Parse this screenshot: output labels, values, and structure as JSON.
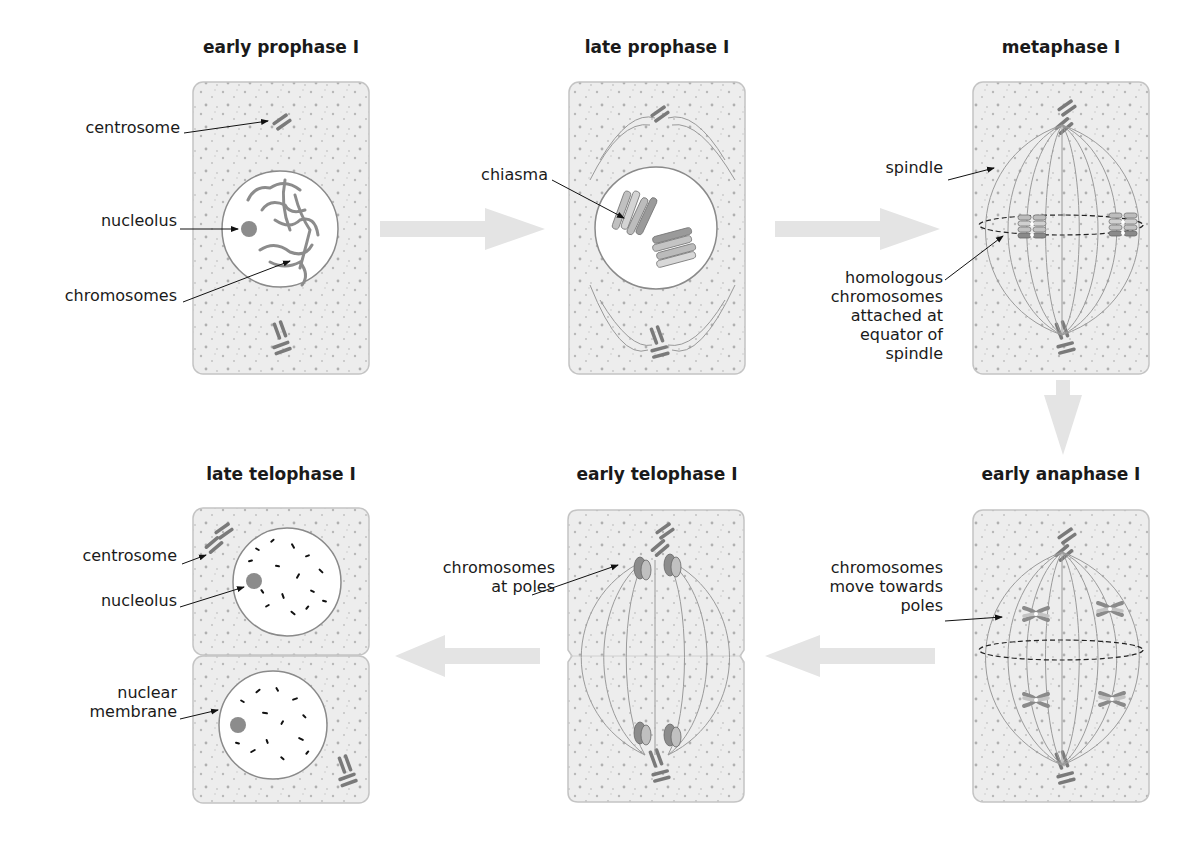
{
  "diagram": {
    "colors": {
      "cell_fill": "#ededed",
      "cell_border": "#c4c4c4",
      "nucleus_fill": "#ffffff",
      "nucleus_border": "#8a8a8a",
      "chromosome_dark": "#7c7c7c",
      "chromosome_light": "#bdbdbd",
      "spindle": "#8c8c8c",
      "flow_arrow": "#e4e4e4",
      "label_text": "#1a1a1a",
      "leader_line": "#111111"
    },
    "stages": [
      {
        "id": "early-prophase-1",
        "title": "early prophase I",
        "labels": [
          "centrosome",
          "nucleolus",
          "chromosomes"
        ]
      },
      {
        "id": "late-prophase-1",
        "title": "late prophase I",
        "labels": [
          "chiasma"
        ]
      },
      {
        "id": "metaphase-1",
        "title": "metaphase I",
        "labels": [
          "spindle",
          "homologous\nchromosomes\nattached at\nequator of\nspindle"
        ]
      },
      {
        "id": "early-anaphase-1",
        "title": "early anaphase I",
        "labels": [
          "chromosomes\nmove towards\npoles"
        ]
      },
      {
        "id": "early-telophase-1",
        "title": "early telophase I",
        "labels": [
          "chromosomes\nat poles"
        ]
      },
      {
        "id": "late-telophase-1",
        "title": "late telophase I",
        "labels": [
          "centrosome",
          "nucleolus",
          "nuclear\nmembrane"
        ]
      }
    ],
    "flow": [
      "early prophase I",
      "late prophase I",
      "metaphase I",
      "early anaphase I",
      "early telophase I",
      "late telophase I"
    ]
  }
}
